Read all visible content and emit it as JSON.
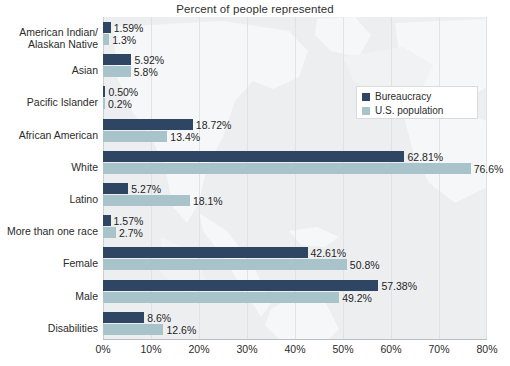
{
  "chart_data": {
    "type": "bar",
    "orientation": "horizontal",
    "title": "Percent of people represented",
    "xlabel": "",
    "ylabel": "",
    "xlim": [
      0,
      80
    ],
    "xticks": [
      0,
      10,
      20,
      30,
      40,
      50,
      60,
      70,
      80
    ],
    "xtick_labels": [
      "0%",
      "10%",
      "20%",
      "30%",
      "40%",
      "50%",
      "60%",
      "70%",
      "80%"
    ],
    "grid": true,
    "legend_position": "upper right",
    "categories": [
      "American Indian/\nAlaskan Native",
      "Asian",
      "Pacific Islander",
      "African American",
      "White",
      "Latino",
      "More than one race",
      "Female",
      "Male",
      "Disabilities"
    ],
    "series": [
      {
        "name": "Bureaucracy",
        "color": "#2f4564",
        "values": [
          1.59,
          5.92,
          0.5,
          18.72,
          62.81,
          5.27,
          1.57,
          42.61,
          57.38,
          8.6
        ],
        "labels": [
          "1.59%",
          "5.92%",
          "0.50%",
          "18.72%",
          "62.81%",
          "5.27%",
          "1.57%",
          "42.61%",
          "57.38%",
          "8.6%"
        ]
      },
      {
        "name": "U.S. population",
        "color": "#a9c3ca",
        "values": [
          1.3,
          5.8,
          0.2,
          13.4,
          76.6,
          18.1,
          2.7,
          50.8,
          49.2,
          12.6
        ],
        "labels": [
          "1.3%",
          "5.8%",
          "0.2%",
          "13.4%",
          "76.6%",
          "18.1%",
          "2.7%",
          "50.8%",
          "49.2%",
          "12.6%"
        ]
      }
    ],
    "colors": {
      "bureaucracy": "#2f4564",
      "us_population": "#a9c3ca",
      "plot_background": "#eceef0",
      "gridline": "#dfe3e5",
      "text": "#2b2b2b"
    }
  },
  "legend": {
    "items": [
      {
        "label": "Bureaucracy",
        "swatch": "dark"
      },
      {
        "label": "U.S. population",
        "swatch": "light"
      }
    ]
  }
}
